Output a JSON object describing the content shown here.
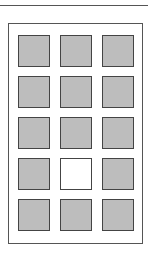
{
  "grid": {
    "rows": 5,
    "columns": 3,
    "cells": [
      {
        "state": "filled"
      },
      {
        "state": "filled"
      },
      {
        "state": "filled"
      },
      {
        "state": "filled"
      },
      {
        "state": "filled"
      },
      {
        "state": "filled"
      },
      {
        "state": "filled"
      },
      {
        "state": "filled"
      },
      {
        "state": "filled"
      },
      {
        "state": "filled"
      },
      {
        "state": "empty"
      },
      {
        "state": "filled"
      },
      {
        "state": "filled"
      },
      {
        "state": "filled"
      },
      {
        "state": "filled"
      }
    ]
  }
}
